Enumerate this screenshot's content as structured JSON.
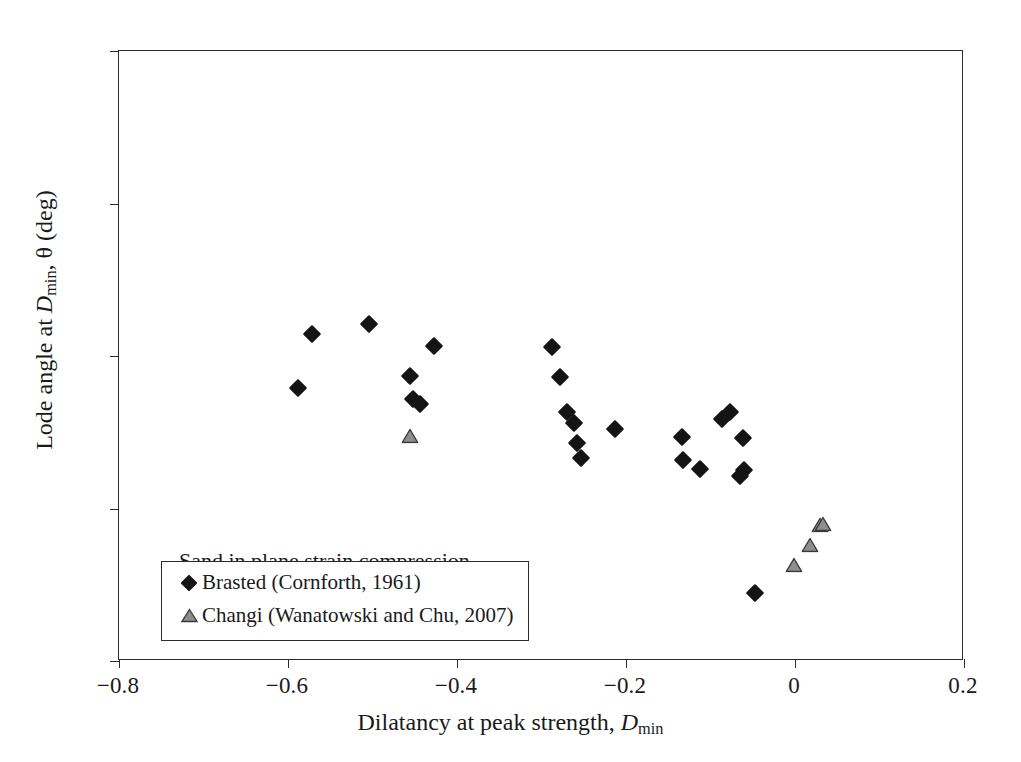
{
  "figure": {
    "annotation": "Sand in plane strain compression"
  },
  "chart_data": {
    "type": "scatter",
    "title": "",
    "xlabel": "Dilatancy at peak strength, D_min",
    "ylabel": "Lode angle at D_min, θ (deg)",
    "xlabel_parts": {
      "pre": "Dilatancy at peak strength, ",
      "sym": "D",
      "sub": "min"
    },
    "ylabel_parts": {
      "pre": "Lode angle at ",
      "sym": "D",
      "sub": "min",
      "post": ", θ (deg)"
    },
    "xlim": [
      -0.8,
      0.2
    ],
    "ylim": [
      10,
      30
    ],
    "xticks": [
      -0.8,
      -0.6,
      -0.4,
      -0.2,
      0,
      0.2
    ],
    "xticklabels": [
      "−0.8",
      "−0.6",
      "−0.4",
      "−0.2",
      "0",
      "0.2"
    ],
    "yticks": [
      10,
      15,
      20,
      25,
      30
    ],
    "yticklabels": [
      "10",
      "15",
      "20",
      "25",
      "30"
    ],
    "grid": false,
    "legend_position": "lower-left-inside",
    "series": [
      {
        "name": "Brasted (Cornforth, 1961)",
        "marker": "filled-diamond",
        "color": "#141414",
        "points": [
          [
            -0.588,
            18.96
          ],
          [
            -0.572,
            20.71
          ],
          [
            -0.504,
            21.05
          ],
          [
            -0.456,
            19.33
          ],
          [
            -0.452,
            18.58
          ],
          [
            -0.444,
            18.42
          ],
          [
            -0.427,
            20.34
          ],
          [
            -0.287,
            20.29
          ],
          [
            -0.278,
            19.32
          ],
          [
            -0.27,
            18.18
          ],
          [
            -0.262,
            17.79
          ],
          [
            -0.258,
            17.14
          ],
          [
            -0.253,
            16.67
          ],
          [
            -0.213,
            17.6
          ],
          [
            -0.134,
            17.33
          ],
          [
            -0.132,
            16.58
          ],
          [
            -0.113,
            16.28
          ],
          [
            -0.086,
            17.92
          ],
          [
            -0.077,
            18.16
          ],
          [
            -0.06,
            16.25
          ],
          [
            -0.065,
            16.05
          ],
          [
            -0.062,
            17.3
          ],
          [
            -0.047,
            12.22
          ]
        ]
      },
      {
        "name": "Changi (Wanatowski and Chu, 2007)",
        "marker": "open-triangle",
        "color": "#8e8e8e",
        "points": [
          [
            -0.456,
            17.38
          ],
          [
            -0.001,
            13.16
          ],
          [
            0.018,
            13.81
          ],
          [
            0.029,
            14.46
          ],
          [
            0.033,
            14.49
          ]
        ]
      }
    ]
  },
  "legend": {
    "entries": [
      {
        "label": "Brasted (Cornforth, 1961)",
        "marker": "filled-diamond"
      },
      {
        "label": "Changi (Wanatowski and Chu, 2007)",
        "marker": "open-triangle"
      }
    ]
  }
}
